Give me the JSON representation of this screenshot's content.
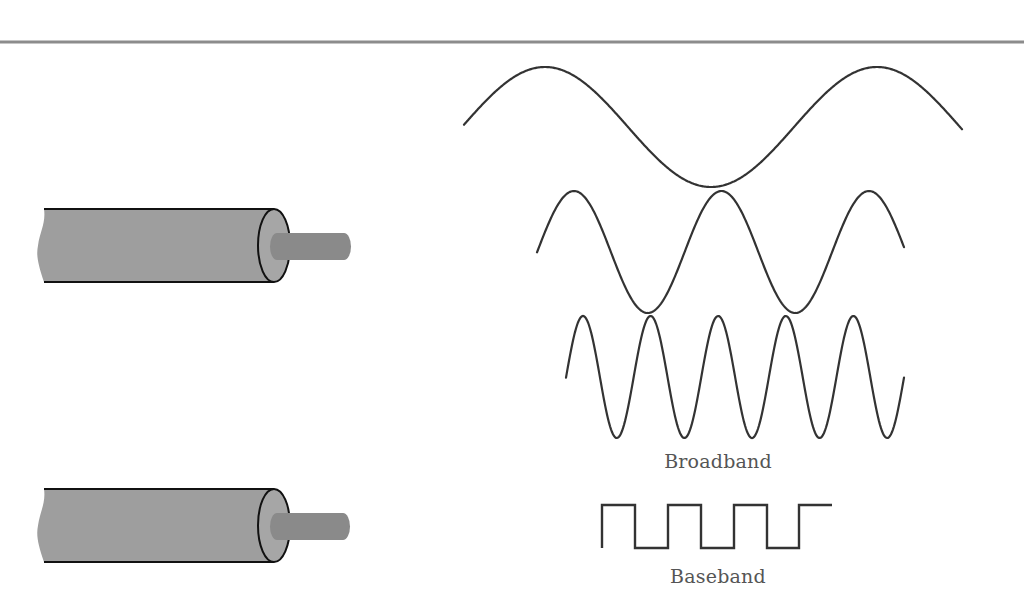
{
  "diagram": {
    "colors": {
      "rule": "#8c8c8c",
      "wave_stroke": "#333333",
      "cable_fill": "#9e9e9e",
      "cable_end_fill": "#a6a6a6",
      "core_fill": "#8a8a8a",
      "outline": "#111111",
      "label": "#555555"
    },
    "top_rule": {
      "y": 42,
      "thickness": 3
    },
    "cables": [
      {
        "id": "broadband-cable",
        "top": 209,
        "bottom": 282,
        "left": 44,
        "end_cx": 274,
        "core_top": 233,
        "core_bottom": 260,
        "core_right": 351
      },
      {
        "id": "baseband-cable",
        "top": 489,
        "bottom": 562,
        "left": 44,
        "end_cx": 274,
        "core_top": 513,
        "core_bottom": 540,
        "core_right": 350
      }
    ],
    "waves": [
      {
        "id": "wave-low-frequency",
        "x_start": 464,
        "x_end": 962,
        "center_y": 127,
        "amplitude": 60,
        "period": 332,
        "peak_x": 545
      },
      {
        "id": "wave-mid-frequency",
        "x_start": 537,
        "x_end": 904,
        "center_y": 252,
        "amplitude": 61,
        "period": 147.5,
        "peak_x": 574
      },
      {
        "id": "wave-high-frequency",
        "x_start": 566,
        "x_end": 904,
        "center_y": 377,
        "amplitude": 61,
        "period": 67.6,
        "peak_x": 583
      }
    ],
    "square_wave": {
      "id": "baseband-square-wave",
      "points": [
        [
          602,
          548
        ],
        [
          602,
          505
        ],
        [
          635,
          505
        ],
        [
          635,
          548
        ],
        [
          668,
          548
        ],
        [
          668,
          505
        ],
        [
          701,
          505
        ],
        [
          701,
          548
        ],
        [
          734,
          548
        ],
        [
          734,
          505
        ],
        [
          767,
          505
        ],
        [
          767,
          548
        ],
        [
          799,
          548
        ],
        [
          799,
          505
        ],
        [
          832,
          505
        ]
      ]
    },
    "labels": {
      "broadband": {
        "text": "Broadband",
        "x": 718,
        "y": 450
      },
      "baseband": {
        "text": "Baseband",
        "x": 718,
        "y": 565
      }
    }
  }
}
